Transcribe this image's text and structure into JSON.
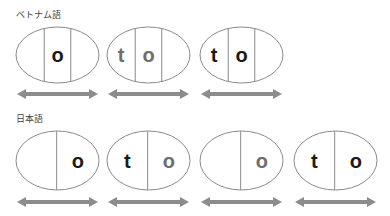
{
  "colors": {
    "stroke": "#8a8a8a",
    "arrow": "#8c8c8c",
    "text_dark": "#1a1a1a",
    "text_gray": "#6e6e6e"
  },
  "rows": [
    {
      "label": "ベトナム語",
      "cells": [
        {
          "divisions": 3,
          "letters": [
            {
              "char": "",
              "color": "dark"
            },
            {
              "char": "o",
              "color": "dark"
            },
            {
              "char": "",
              "color": "dark"
            }
          ]
        },
        {
          "divisions": 3,
          "letters": [
            {
              "char": "t",
              "color": "gray"
            },
            {
              "char": "o",
              "color": "gray"
            },
            {
              "char": "",
              "color": "gray"
            }
          ]
        },
        {
          "divisions": 3,
          "letters": [
            {
              "char": "t",
              "color": "dark"
            },
            {
              "char": "o",
              "color": "dark"
            },
            {
              "char": "",
              "color": "dark"
            }
          ]
        }
      ]
    },
    {
      "label": "日本語",
      "cells": [
        {
          "divisions": 2,
          "letters": [
            {
              "char": "",
              "color": "dark"
            },
            {
              "char": "o",
              "color": "dark"
            }
          ]
        },
        {
          "divisions": 2,
          "letters": [
            {
              "char": "t",
              "color": "dark"
            },
            {
              "char": "o",
              "color": "gray"
            }
          ]
        },
        {
          "divisions": 2,
          "letters": [
            {
              "char": "",
              "color": "gray"
            },
            {
              "char": "o",
              "color": "gray"
            }
          ]
        },
        {
          "divisions": 2,
          "letters": [
            {
              "char": "t",
              "color": "dark"
            },
            {
              "char": "o",
              "color": "dark"
            }
          ]
        }
      ]
    }
  ]
}
